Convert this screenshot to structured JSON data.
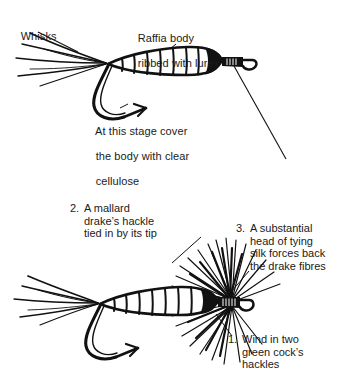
{
  "page": {
    "background_color": "#ffffff",
    "ink_color": "#1a1a1a"
  },
  "figures": [
    {
      "id": "figure-top",
      "caption_labels": [
        "whisks",
        "raffia",
        "cellulose"
      ]
    },
    {
      "id": "figure-bottom",
      "caption_labels": [
        "step2",
        "step3",
        "step1"
      ]
    }
  ],
  "labels": {
    "whisks": {
      "text": "Whisks",
      "lines": [
        "Whisks"
      ]
    },
    "raffia": {
      "line1": "Raffia body",
      "line2": "ribbed with lurex"
    },
    "cellulose": {
      "line1": "At this stage cover",
      "line2": "the body with clear",
      "line3": "cellulose"
    },
    "step1": {
      "number": "1.",
      "line1": "Wind in two",
      "line2": "green cock’s",
      "line3": "hackles"
    },
    "step2": {
      "number": "2.",
      "line1": "A mallard",
      "line2": "drake’s hackle",
      "line3": "tied in by its tip"
    },
    "step3": {
      "number": "3.",
      "line1": "A substantial",
      "line2": "head of tying",
      "line3": "silk forces back",
      "line4": "the drake fibres"
    }
  }
}
